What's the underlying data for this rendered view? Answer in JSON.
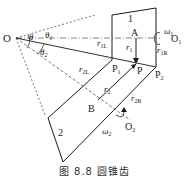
{
  "figure": {
    "caption": "图 8.8   圆锥齿",
    "labels": {
      "O": "O",
      "O1": "O",
      "O1_sub": "1",
      "O2": "O",
      "O2_sub": "2",
      "theta": "θ",
      "theta1": "θ",
      "theta1_sub": "1",
      "theta2": "θ",
      "theta2_sub": "2",
      "gear1": "1",
      "gear2": "2",
      "A": "A",
      "B": "B",
      "P": "P",
      "P1": "P",
      "P1_sub": "1",
      "P2": "P",
      "P2_sub": "2",
      "r1": "r",
      "r1_sub": "1",
      "r1L": "r",
      "r1L_sub": "1L",
      "r1R": "r",
      "r1R_sub": "1R",
      "r2": "r",
      "r2_sub": "2",
      "r2L": "r",
      "r2L_sub": "2L",
      "r2R": "r",
      "r2R_sub": "2R",
      "omega1": "ω",
      "omega1_sub": "1",
      "omega2": "ω",
      "omega2_sub": "2"
    },
    "colors": {
      "line": "#1a1a1a",
      "dashed": "#555555"
    }
  }
}
